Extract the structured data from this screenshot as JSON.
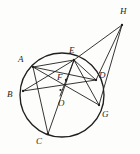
{
  "figure": {
    "stroke_color": "#1f1f1f",
    "background_color": "#fdfdfb",
    "circle": {
      "cx": 62,
      "cy": 95,
      "r": 42,
      "center_label": "O"
    },
    "points": [
      {
        "id": "A",
        "label": "A",
        "x": 33,
        "y": 67,
        "label_x": 18,
        "label_y": 55,
        "on_circle": true
      },
      {
        "id": "B",
        "label": "B",
        "x": 23,
        "y": 91,
        "label_x": 7,
        "label_y": 90,
        "on_circle": true
      },
      {
        "id": "C",
        "label": "C",
        "x": 48,
        "y": 134,
        "label_x": 36,
        "label_y": 137,
        "on_circle": true
      },
      {
        "id": "D",
        "label": "D",
        "x": 96,
        "y": 80,
        "label_x": 99,
        "label_y": 71,
        "on_circle": true
      },
      {
        "id": "E",
        "label": "E",
        "x": 74,
        "y": 60,
        "label_x": 69,
        "label_y": 46,
        "on_circle": true
      },
      {
        "id": "G",
        "label": "G",
        "x": 99,
        "y": 105,
        "label_x": 102,
        "label_y": 110,
        "on_circle": true
      },
      {
        "id": "F",
        "label": "F",
        "x": 66,
        "y": 80,
        "label_x": 57,
        "label_y": 73,
        "on_circle": false
      },
      {
        "id": "H",
        "label": "H",
        "x": 122,
        "y": 25,
        "label_x": 120,
        "label_y": 7,
        "on_circle": false
      },
      {
        "id": "O",
        "label": "O",
        "x": 60,
        "y": 96,
        "label_x": 58,
        "label_y": 99,
        "on_circle": false
      }
    ],
    "segments": [
      {
        "name": "A-D",
        "from": "A",
        "to": "D"
      },
      {
        "name": "A-G",
        "from": "A",
        "to": "G"
      },
      {
        "name": "A-C",
        "from": "A",
        "to": "C"
      },
      {
        "name": "A-E",
        "from": "A",
        "to": "E"
      },
      {
        "name": "B-E",
        "from": "B",
        "to": "E"
      },
      {
        "name": "B-D",
        "from": "B",
        "to": "D"
      },
      {
        "name": "C-E",
        "from": "C",
        "to": "E"
      },
      {
        "name": "E-H",
        "from": "E",
        "to": "H"
      },
      {
        "name": "D-H",
        "from": "D",
        "to": "H"
      },
      {
        "name": "G-H",
        "from": "G",
        "to": "H"
      },
      {
        "name": "E-D",
        "from": "E",
        "to": "D"
      },
      {
        "name": "E-G",
        "from": "E",
        "to": "G"
      },
      {
        "name": "O-E",
        "from": "O",
        "to": "E"
      }
    ],
    "center_dot": {
      "x": 60.5,
      "y": 90,
      "r": 1.1
    }
  }
}
